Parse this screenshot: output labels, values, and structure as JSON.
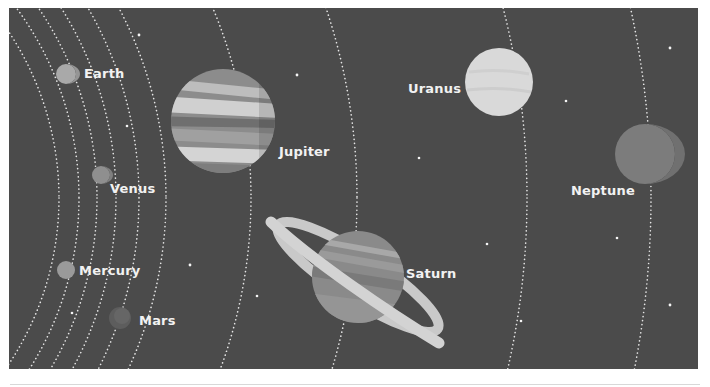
{
  "scene": {
    "background": "#4b4b4b",
    "orbit_color": "#e6e6e6",
    "star_color": "#f5f5f5"
  },
  "planets": [
    {
      "name": "Earth",
      "label": "Earth",
      "cx": 57,
      "cy": 66,
      "r": 10,
      "fill": "#a9a9a9"
    },
    {
      "name": "Venus",
      "label": "Venus",
      "cx": 92,
      "cy": 167,
      "r": 9,
      "fill": "#8f8f8f"
    },
    {
      "name": "Mercury",
      "label": "Mercury",
      "cx": 57,
      "cy": 262,
      "r": 9,
      "fill": "#9a9a9a"
    },
    {
      "name": "Mars",
      "label": "Mars",
      "cx": 111,
      "cy": 310,
      "r": 11,
      "fill": "#5d5d5d"
    },
    {
      "name": "Jupiter",
      "label": "Jupiter",
      "cx": 214,
      "cy": 121,
      "r": 52,
      "fill": "#8c8c8c"
    },
    {
      "name": "Saturn",
      "label": "Saturn",
      "cx": 349,
      "cy": 269,
      "r": 46,
      "fill": "#8a8a8a"
    },
    {
      "name": "Uranus",
      "label": "Uranus",
      "cx": 490,
      "cy": 74,
      "r": 34,
      "fill": "#d9d9d9"
    },
    {
      "name": "Neptune",
      "label": "Neptune",
      "cx": 636,
      "cy": 146,
      "r": 30,
      "fill": "#7c7c7c"
    }
  ],
  "labels": {
    "earth": {
      "text": "Earth",
      "x": 75,
      "y": 58
    },
    "venus": {
      "text": "Venus",
      "x": 101,
      "y": 173
    },
    "mercury": {
      "text": "Mercury",
      "x": 70,
      "y": 255
    },
    "mars": {
      "text": "Mars",
      "x": 130,
      "y": 305
    },
    "jupiter": {
      "text": "Jupiter",
      "x": 270,
      "y": 136
    },
    "saturn": {
      "text": "Saturn",
      "x": 397,
      "y": 258
    },
    "uranus": {
      "text": "Uranus",
      "x": 399,
      "y": 73
    },
    "neptune": {
      "text": "Neptune",
      "x": 562,
      "y": 175
    }
  }
}
